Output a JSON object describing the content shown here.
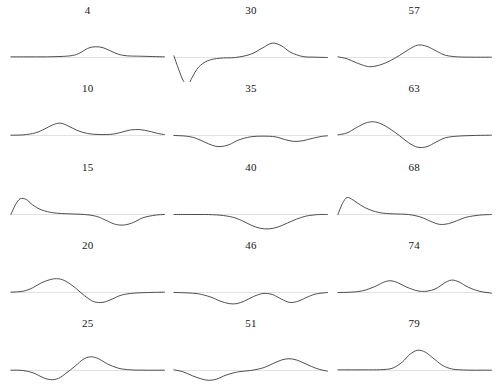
{
  "figure": {
    "type": "small-multiples-grid",
    "rows": 5,
    "columns": 3,
    "background_color": "#ffffff",
    "curve_color": "#3b3b3b",
    "baseline_color": "#cfcfcf",
    "label_color": "#141414"
  },
  "chart_data": {
    "type": "line",
    "title": "",
    "xlabel": "",
    "ylabel": "",
    "grid": false,
    "legend": "none",
    "panel_label_position": "above",
    "xlim": [
      0,
      100
    ],
    "ylim": [
      -1,
      1
    ],
    "shared_axes": true,
    "panels": [
      {
        "label": "4",
        "row": 1,
        "column": 1,
        "description": "flat baseline with a single small smooth bump centered near x=55",
        "x": [
          0,
          8,
          16,
          24,
          32,
          40,
          45,
          50,
          55,
          60,
          65,
          70,
          76,
          84,
          92,
          100
        ],
        "y": [
          0.02,
          0.02,
          0.02,
          0.02,
          0.03,
          0.06,
          0.14,
          0.28,
          0.33,
          0.3,
          0.2,
          0.1,
          0.05,
          0.04,
          0.03,
          0.02
        ]
      },
      {
        "label": "30",
        "row": 1,
        "column": 2,
        "description": "sharp deep V-shaped negative spike at the far left, then a rounded positive bump near x=65",
        "x": [
          0,
          3,
          6,
          9,
          12,
          16,
          22,
          30,
          40,
          50,
          58,
          64,
          70,
          76,
          84,
          92,
          100
        ],
        "y": [
          0.05,
          -0.35,
          -0.7,
          -0.86,
          -0.6,
          -0.3,
          -0.1,
          -0.02,
          0.0,
          0.1,
          0.3,
          0.44,
          0.36,
          0.16,
          0.03,
          0.01,
          0.0
        ]
      },
      {
        "label": "57",
        "row": 1,
        "column": 3,
        "description": "shallow dip near x=22 followed by a moderate bump near x=55",
        "x": [
          0,
          6,
          12,
          18,
          22,
          28,
          34,
          40,
          46,
          52,
          58,
          64,
          70,
          78,
          88,
          100
        ],
        "y": [
          0.02,
          -0.04,
          -0.16,
          -0.26,
          -0.28,
          -0.22,
          -0.1,
          0.06,
          0.24,
          0.38,
          0.34,
          0.2,
          0.07,
          0.02,
          0.01,
          0.01
        ]
      },
      {
        "label": "10",
        "row": 2,
        "column": 1,
        "description": "medium bump near x=32 and a smaller low bump near x=80",
        "x": [
          0,
          8,
          16,
          22,
          27,
          32,
          37,
          43,
          50,
          58,
          66,
          72,
          78,
          84,
          90,
          96,
          100
        ],
        "y": [
          0.01,
          0.02,
          0.08,
          0.2,
          0.32,
          0.38,
          0.3,
          0.16,
          0.06,
          0.03,
          0.04,
          0.1,
          0.17,
          0.18,
          0.13,
          0.06,
          0.03
        ]
      },
      {
        "label": "35",
        "row": 2,
        "column": 2,
        "description": "rounded dip near x=30 and a shallower dip near x=76",
        "x": [
          0,
          8,
          14,
          20,
          25,
          30,
          36,
          42,
          50,
          58,
          66,
          72,
          78,
          84,
          90,
          96,
          100
        ],
        "y": [
          0.0,
          -0.02,
          -0.08,
          -0.2,
          -0.3,
          -0.34,
          -0.28,
          -0.14,
          -0.04,
          -0.02,
          -0.04,
          -0.12,
          -0.18,
          -0.16,
          -0.09,
          -0.03,
          -0.01
        ]
      },
      {
        "label": "63",
        "row": 2,
        "column": 3,
        "description": "positive bump near x=25 followed by a negative dip near x=55, sinusoid-like",
        "x": [
          0,
          6,
          12,
          18,
          23,
          28,
          34,
          40,
          46,
          52,
          58,
          64,
          70,
          78,
          88,
          100
        ],
        "y": [
          0.02,
          0.08,
          0.24,
          0.38,
          0.42,
          0.36,
          0.2,
          0.0,
          -0.22,
          -0.36,
          -0.34,
          -0.2,
          -0.07,
          -0.02,
          0.0,
          0.01
        ]
      },
      {
        "label": "15",
        "row": 3,
        "column": 1,
        "description": "sharp triangular peak at the far left with exponential decay, then a broad dip near x=70",
        "x": [
          0,
          3,
          6,
          10,
          14,
          20,
          28,
          38,
          48,
          56,
          62,
          68,
          74,
          80,
          86,
          94,
          100
        ],
        "y": [
          0.0,
          0.3,
          0.48,
          0.46,
          0.3,
          0.14,
          0.05,
          0.02,
          0.0,
          -0.06,
          -0.18,
          -0.3,
          -0.32,
          -0.24,
          -0.1,
          -0.02,
          0.0
        ]
      },
      {
        "label": "40",
        "row": 3,
        "column": 2,
        "description": "single broad smooth dip centered near x=60",
        "x": [
          0,
          10,
          20,
          30,
          38,
          44,
          50,
          56,
          62,
          68,
          74,
          80,
          86,
          92,
          96,
          100
        ],
        "y": [
          0.0,
          0.0,
          0.0,
          -0.02,
          -0.08,
          -0.18,
          -0.32,
          -0.42,
          -0.44,
          -0.38,
          -0.26,
          -0.14,
          -0.05,
          -0.01,
          0.0,
          0.0
        ]
      },
      {
        "label": "68",
        "row": 3,
        "column": 3,
        "description": "sharp triangular peak at the far left with fast decay, then a dip near x=64",
        "x": [
          0,
          3,
          6,
          10,
          15,
          21,
          28,
          36,
          46,
          54,
          60,
          66,
          72,
          78,
          84,
          92,
          100
        ],
        "y": [
          0.0,
          0.34,
          0.52,
          0.44,
          0.28,
          0.14,
          0.05,
          0.02,
          0.0,
          -0.08,
          -0.2,
          -0.3,
          -0.28,
          -0.18,
          -0.08,
          -0.02,
          0.0
        ]
      },
      {
        "label": "20",
        "row": 4,
        "column": 1,
        "description": "bump near x=30 immediately followed by a dip near x=55",
        "x": [
          0,
          8,
          14,
          20,
          26,
          31,
          36,
          42,
          48,
          54,
          60,
          66,
          72,
          80,
          90,
          100
        ],
        "y": [
          0.01,
          0.04,
          0.14,
          0.3,
          0.4,
          0.42,
          0.34,
          0.14,
          -0.1,
          -0.28,
          -0.3,
          -0.2,
          -0.08,
          -0.02,
          0.0,
          0.01
        ]
      },
      {
        "label": "46",
        "row": 4,
        "column": 2,
        "description": "two rounded dips, one near x=38 and one near x=74",
        "x": [
          0,
          8,
          16,
          24,
          30,
          36,
          41,
          46,
          52,
          58,
          64,
          70,
          75,
          80,
          86,
          92,
          100
        ],
        "y": [
          0.0,
          -0.01,
          -0.04,
          -0.14,
          -0.26,
          -0.34,
          -0.34,
          -0.26,
          -0.12,
          -0.03,
          -0.06,
          -0.2,
          -0.3,
          -0.28,
          -0.16,
          -0.05,
          0.0
        ]
      },
      {
        "label": "74",
        "row": 4,
        "column": 3,
        "description": "two positive bumps, one near x=33 and one near x=72",
        "x": [
          0,
          8,
          16,
          24,
          29,
          34,
          39,
          45,
          52,
          58,
          64,
          69,
          74,
          79,
          85,
          92,
          100
        ],
        "y": [
          0.0,
          0.01,
          0.05,
          0.18,
          0.3,
          0.36,
          0.3,
          0.16,
          0.05,
          0.04,
          0.12,
          0.28,
          0.38,
          0.32,
          0.16,
          0.04,
          -0.02
        ]
      },
      {
        "label": "25",
        "row": 5,
        "column": 1,
        "description": "dip near x=28 followed by a taller bump near x=50",
        "x": [
          0,
          8,
          15,
          21,
          26,
          31,
          36,
          42,
          47,
          52,
          57,
          63,
          70,
          78,
          88,
          100
        ],
        "y": [
          0.01,
          0.0,
          -0.08,
          -0.22,
          -0.28,
          -0.24,
          -0.08,
          0.14,
          0.34,
          0.42,
          0.36,
          0.2,
          0.07,
          0.02,
          0.01,
          0.01
        ]
      },
      {
        "label": "51",
        "row": 5,
        "column": 2,
        "description": "dip near x=24 and a broad bump near x=74",
        "x": [
          0,
          6,
          12,
          18,
          23,
          28,
          34,
          42,
          50,
          58,
          64,
          70,
          75,
          80,
          86,
          93,
          100
        ],
        "y": [
          0.02,
          -0.04,
          -0.16,
          -0.26,
          -0.3,
          -0.26,
          -0.14,
          -0.04,
          0.0,
          0.08,
          0.2,
          0.32,
          0.36,
          0.32,
          0.2,
          0.06,
          -0.02
        ]
      },
      {
        "label": "79",
        "row": 5,
        "column": 3,
        "description": "single tall smooth bump centered near x=52 on an otherwise flat baseline",
        "x": [
          0,
          10,
          20,
          30,
          36,
          42,
          47,
          52,
          57,
          62,
          68,
          74,
          80,
          88,
          94,
          100
        ],
        "y": [
          0.02,
          0.02,
          0.02,
          0.03,
          0.08,
          0.26,
          0.5,
          0.62,
          0.56,
          0.38,
          0.16,
          0.05,
          0.02,
          0.01,
          0.01,
          0.01
        ]
      }
    ]
  }
}
